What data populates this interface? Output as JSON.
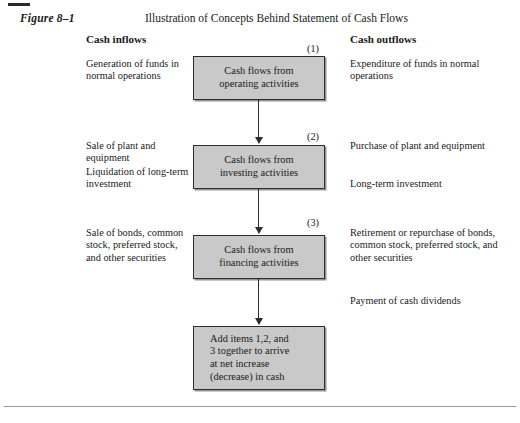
{
  "figure": {
    "label": "Figure 8–1",
    "title": "Illustration of Concepts Behind Statement of Cash Flows"
  },
  "columns": {
    "left_heading": "Cash inflows",
    "right_heading": "Cash outflows"
  },
  "left_notes": [
    {
      "text": "Generation of funds in normal operations",
      "top": 58
    },
    {
      "text": "Sale of plant and equipment",
      "top": 140
    },
    {
      "text": "Liquidation of long-term investment",
      "top": 166
    },
    {
      "text": "Sale of bonds, common stock, preferred stock, and other securities",
      "top": 227
    }
  ],
  "right_notes": [
    {
      "text": "Expenditure of funds in normal operations",
      "top": 58
    },
    {
      "text": "Purchase of plant and equipment",
      "top": 140
    },
    {
      "text": "Long-term investment",
      "top": 178
    },
    {
      "text": "Retirement or repurchase of bonds, common stock, preferred stock, and other securities",
      "top": 227
    },
    {
      "text": "Payment of cash dividends",
      "top": 295
    }
  ],
  "boxes": [
    {
      "id": "operating",
      "lines": [
        "Cash flows from",
        "operating activities"
      ],
      "top": 56,
      "height": 44,
      "step": "(1)",
      "step_top": 43
    },
    {
      "id": "investing",
      "lines": [
        "Cash flows from",
        "investing activities"
      ],
      "top": 145,
      "height": 44,
      "step": "(2)",
      "step_top": 131
    },
    {
      "id": "financing",
      "lines": [
        "Cash flows from",
        "financing activities"
      ],
      "top": 235,
      "height": 44,
      "step": "(3)",
      "step_top": 217
    },
    {
      "id": "total",
      "lines": [
        "Add items 1,2, and",
        "3 together to arrive",
        "at net increase",
        "(decrease) in cash"
      ],
      "top": 326,
      "height": 64,
      "step": "",
      "step_top": 0
    }
  ],
  "arrows": [
    {
      "top": 100,
      "height": 43
    },
    {
      "top": 189,
      "height": 44
    },
    {
      "top": 279,
      "height": 45
    }
  ],
  "colors": {
    "box_fill": "#c9c9c9",
    "box_border": "#2d2d2d",
    "text": "#1a1a1a",
    "rule": "#9a9a9a",
    "page_bg": "#ffffff"
  }
}
